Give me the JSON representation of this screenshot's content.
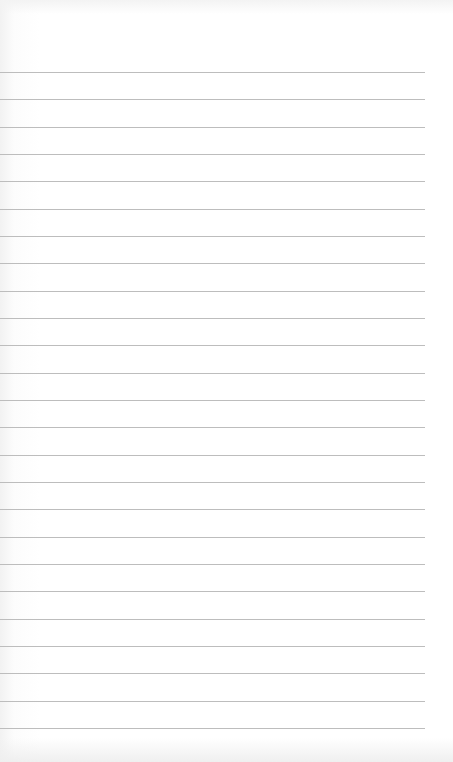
{
  "page": {
    "type": "lined-paper",
    "background_color": "#ffffff",
    "line_color": "#bdbdbd",
    "line_count": 25,
    "first_line_y": 72,
    "line_spacing": 27.33,
    "line_width": 425
  }
}
